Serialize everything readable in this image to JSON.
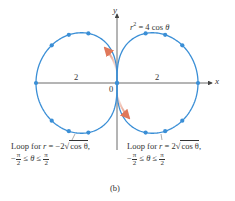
{
  "figure": {
    "label": "(b)",
    "equation": "r² = 4 cos θ",
    "equation_parts": {
      "r": "r",
      "exp": "2",
      "rhs": " = 4 cos ",
      "theta": "θ"
    },
    "axes": {
      "x_label": "x",
      "y_label": "y",
      "origin_label": "0"
    },
    "tick_labels": {
      "left": "2",
      "right": "2"
    },
    "colors": {
      "curve": "#3b8fd6",
      "arrow": "#e0785a",
      "axis": "#444444",
      "text": "#333333"
    },
    "left_caption": {
      "line1_prefix": "Loop for ",
      "r": "r",
      "eq": " = −2",
      "radicand": "cos θ",
      "comma": ",",
      "line2_left": "−",
      "pi": "π",
      "two": "2",
      "ineq": " ≤ θ ≤ "
    },
    "right_caption": {
      "line1_prefix": "Loop for ",
      "r": "r",
      "eq": " = 2",
      "radicand": "cos θ",
      "comma": ",",
      "line2_left": "−",
      "pi": "π",
      "two": "2",
      "ineq": " ≤ θ ≤ "
    }
  },
  "chart_data": {
    "type": "line",
    "xlabel": "x",
    "ylabel": "y",
    "series": [
      {
        "name": "Loop for r = 2√(cos θ), −π/2 ≤ θ ≤ π/2",
        "side": "right",
        "x_range": [
          0,
          2
        ]
      },
      {
        "name": "Loop for r = −2√(cos θ), −π/2 ≤ θ ≤ π/2",
        "side": "left",
        "x_range": [
          -2,
          0
        ]
      }
    ],
    "annotations": [
      "2",
      "2",
      "0",
      "(b)"
    ],
    "grid": false
  }
}
